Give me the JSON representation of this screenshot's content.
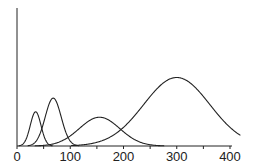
{
  "chart_data": {
    "type": "line",
    "title": "",
    "xlabel": "",
    "ylabel": "",
    "xlim": [
      0,
      420
    ],
    "ylim": [
      0,
      1
    ],
    "x_ticks": [
      "0",
      "100",
      "200",
      "300",
      "400"
    ],
    "y_ticks": [],
    "grid": false,
    "legend": null,
    "series": [
      {
        "name": "peak 1",
        "shape": "gaussian",
        "center": 35,
        "width_sd": 10,
        "height": 0.25
      },
      {
        "name": "peak 2",
        "shape": "gaussian",
        "center": 68,
        "width_sd": 15,
        "height": 0.35
      },
      {
        "name": "peak 3",
        "shape": "gaussian",
        "center": 155,
        "width_sd": 38,
        "height": 0.21
      },
      {
        "name": "peak 4",
        "shape": "gaussian",
        "center": 300,
        "width_sd": 62,
        "height": 0.5
      }
    ],
    "line_color": "#222222"
  }
}
